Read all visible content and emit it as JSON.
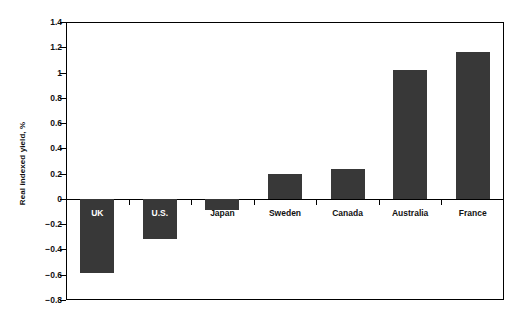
{
  "chart_data": {
    "type": "bar",
    "title": "",
    "xlabel": "",
    "ylabel": "Real indexed yield, %",
    "categories": [
      "UK",
      "U.S.",
      "Japan",
      "Sweden",
      "Canada",
      "Australia",
      "France"
    ],
    "values": [
      -0.59,
      -0.32,
      -0.09,
      0.2,
      0.24,
      1.02,
      1.16
    ],
    "ylim": [
      -0.8,
      1.4
    ],
    "ytick_labels": [
      "1.4",
      "1.2",
      "1",
      "0.8",
      "0.6",
      "0.4",
      "0.2",
      "0",
      "-0.2",
      "-0.4",
      "-0.6",
      "-0.8"
    ],
    "ytick_values": [
      1.4,
      1.2,
      1.0,
      0.8,
      0.6,
      0.4,
      0.2,
      0.0,
      -0.2,
      -0.4,
      -0.6,
      -0.8
    ],
    "grid": false,
    "legend": null,
    "bar_color": "#383838",
    "axis_color": "#000000",
    "background_color": "#ffffff",
    "label_placement": [
      "inside",
      "inside",
      "outside",
      "outside",
      "outside",
      "outside",
      "outside"
    ]
  }
}
